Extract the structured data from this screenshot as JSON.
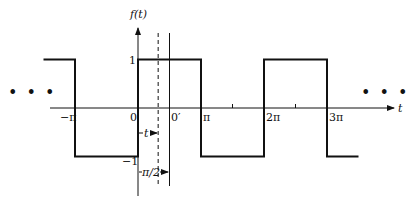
{
  "diagram": {
    "type": "square-wave",
    "y_axis_label": "f(t)",
    "x_axis_label": "t",
    "continuation_left": "• • •",
    "continuation_right": "• • •",
    "levels": {
      "high": 1,
      "low": -1
    },
    "level_labels": {
      "high": "1",
      "low": "−1"
    },
    "x_tick_labels": [
      {
        "x": -1,
        "text": "−π"
      },
      {
        "x": 0,
        "text": "0"
      },
      {
        "x": 1,
        "text": "π"
      },
      {
        "x": 2,
        "text": "2π"
      },
      {
        "x": 3,
        "text": "3π"
      }
    ],
    "minor_ticks": [
      1.5,
      2.5
    ],
    "origin_shift_label": "0′",
    "shift_t_label": "t",
    "shift_half_pi_label": "π/2",
    "waveform": {
      "x_start": -1.5,
      "x_end": 3.5,
      "segments": [
        {
          "from": -1.5,
          "to": -1,
          "value": 1
        },
        {
          "from": -1,
          "to": 0,
          "value": -1
        },
        {
          "from": 0,
          "to": 1,
          "value": 1
        },
        {
          "from": 1,
          "to": 2,
          "value": -1
        },
        {
          "from": 2,
          "to": 3,
          "value": 1
        },
        {
          "from": 3,
          "to": 3.5,
          "value": -1
        }
      ]
    },
    "dashed_line_at": 0.32,
    "solid_line_at": 0.5
  }
}
